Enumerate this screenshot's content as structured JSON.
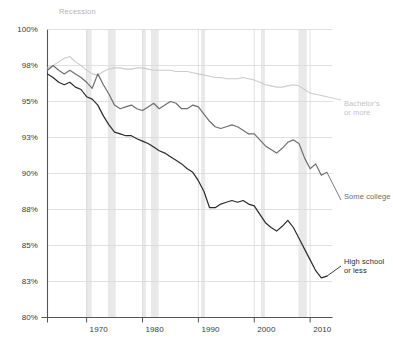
{
  "chart_data": {
    "type": "line",
    "title": "",
    "subtitle": "",
    "xlabel": "",
    "ylabel": "",
    "xlim": [
      1963,
      2014
    ],
    "ylim": [
      80,
      100
    ],
    "grid": true,
    "legend_position": "right-inline",
    "y_ticks": [
      "100%",
      "98%",
      "95%",
      "93%",
      "90%",
      "88%",
      "85%",
      "83%",
      "80%"
    ],
    "y_tick_values": [
      100,
      98,
      95,
      93,
      90,
      88,
      85,
      83,
      80
    ],
    "x_ticks": [
      "1970",
      "1980",
      "1990",
      "2000",
      "2010"
    ],
    "x_tick_values": [
      1970,
      1980,
      1990,
      2000,
      2010
    ],
    "annotations": [
      {
        "name": "recession-label",
        "text": "Recession",
        "x": 1966.5,
        "y": 100.6
      }
    ],
    "recession_bands": [
      {
        "start": 1969.9,
        "end": 1970.9
      },
      {
        "start": 1973.8,
        "end": 1975.2
      },
      {
        "start": 1980.0,
        "end": 1980.6
      },
      {
        "start": 1981.5,
        "end": 1982.9
      },
      {
        "start": 1990.5,
        "end": 1991.2
      },
      {
        "start": 2001.2,
        "end": 2001.9
      },
      {
        "start": 2007.9,
        "end": 2009.4
      }
    ],
    "series": [
      {
        "name": "Bachelor's or more",
        "color": "#cccccc",
        "label": "Bachelor's or more",
        "label_lines": [
          "Bachelor's",
          "or more"
        ],
        "x": [
          1963,
          1964,
          1965,
          1966,
          1967,
          1968,
          1969,
          1970,
          1971,
          1972,
          1973,
          1974,
          1975,
          1976,
          1977,
          1978,
          1979,
          1980,
          1981,
          1982,
          1983,
          1984,
          1985,
          1986,
          1987,
          1988,
          1989,
          1990,
          1991,
          1992,
          1993,
          1994,
          1995,
          1996,
          1997,
          1998,
          1999,
          2000,
          2001,
          2002,
          2003,
          2004,
          2005,
          2006,
          2007,
          2008,
          2009,
          2010,
          2011,
          2012,
          2013
        ],
        "values": [
          97.8,
          98.0,
          98.2,
          98.4,
          98.5,
          98.2,
          98.0,
          97.6,
          97.3,
          97.2,
          97.5,
          97.7,
          97.8,
          97.8,
          97.7,
          97.7,
          97.8,
          97.8,
          97.7,
          97.6,
          97.6,
          97.6,
          97.6,
          97.5,
          97.5,
          97.5,
          97.4,
          97.3,
          97.2,
          97.1,
          97.0,
          97.0,
          96.9,
          96.9,
          96.9,
          97.0,
          96.9,
          96.8,
          96.6,
          96.4,
          96.3,
          96.2,
          96.2,
          96.3,
          96.4,
          96.3,
          96.0,
          95.7,
          95.6,
          95.5,
          95.4
        ]
      },
      {
        "name": "Some college",
        "color": "#6e6e6e",
        "label": "Some college",
        "label_lines": [
          "Some college"
        ],
        "x": [
          1963,
          1964,
          1965,
          1966,
          1967,
          1968,
          1969,
          1970,
          1971,
          1972,
          1973,
          1974,
          1975,
          1976,
          1977,
          1978,
          1979,
          1980,
          1981,
          1982,
          1983,
          1984,
          1985,
          1986,
          1987,
          1988,
          1989,
          1990,
          1991,
          1992,
          1993,
          1994,
          1995,
          1996,
          1997,
          1998,
          1999,
          2000,
          2001,
          2002,
          2003,
          2004,
          2005,
          2006,
          2007,
          2008,
          2009,
          2010,
          2011,
          2012,
          2013
        ],
        "values": [
          97.6,
          98.0,
          97.6,
          97.3,
          97.6,
          97.3,
          97.0,
          96.6,
          96.1,
          97.3,
          96.4,
          95.6,
          94.8,
          94.6,
          94.7,
          94.8,
          94.6,
          94.5,
          94.7,
          94.9,
          94.6,
          94.8,
          95.0,
          94.9,
          94.6,
          94.6,
          94.8,
          94.7,
          94.3,
          93.9,
          93.6,
          93.5,
          93.6,
          93.7,
          93.6,
          93.4,
          93.2,
          93.2,
          92.8,
          92.3,
          92.0,
          91.7,
          92.1,
          92.6,
          92.8,
          92.5,
          91.3,
          90.4,
          90.8,
          89.9,
          90.1
        ]
      },
      {
        "name": "High school or less",
        "color": "#2b2b2b",
        "label": "High school or less",
        "label_lines": [
          "High school",
          "or less"
        ],
        "x": [
          1963,
          1964,
          1965,
          1966,
          1967,
          1968,
          1969,
          1970,
          1971,
          1972,
          1973,
          1974,
          1975,
          1976,
          1977,
          1978,
          1979,
          1980,
          1981,
          1982,
          1983,
          1984,
          1985,
          1986,
          1987,
          1988,
          1989,
          1990,
          1991,
          1992,
          1993,
          1994,
          1995,
          1996,
          1997,
          1998,
          1999,
          2000,
          2001,
          2002,
          2003,
          2004,
          2005,
          2006,
          2007,
          2008,
          2009,
          2010,
          2011,
          2012,
          2013
        ],
        "values": [
          97.3,
          97.0,
          96.6,
          96.4,
          96.6,
          96.2,
          96.0,
          95.4,
          95.2,
          94.8,
          94.2,
          93.7,
          93.3,
          93.2,
          93.1,
          93.1,
          92.9,
          92.7,
          92.5,
          92.2,
          91.9,
          91.7,
          91.4,
          91.1,
          90.8,
          90.4,
          90.1,
          89.6,
          89.0,
          88.1,
          88.1,
          88.3,
          88.4,
          88.5,
          88.4,
          88.5,
          88.3,
          88.2,
          87.6,
          86.9,
          86.5,
          86.2,
          86.6,
          87.1,
          86.5,
          85.6,
          84.8,
          84.2,
          83.6,
          83.2,
          83.3
        ]
      }
    ]
  },
  "axis": {
    "y_tick_labels": [
      "100%",
      "98%",
      "95%",
      "93%",
      "90%",
      "88%",
      "85%",
      "83%",
      "80%"
    ],
    "x_tick_labels": [
      "1970",
      "1980",
      "1990",
      "2000",
      "2010"
    ]
  },
  "labels": {
    "recession": "Recession",
    "bachelors_line1": "Bachelor's",
    "bachelors_line2": "or more",
    "some_college": "Some college",
    "highschool_line1": "High school",
    "highschool_line2": "or less"
  },
  "colors": {
    "bachelors": "#cccccc",
    "some_college": "#6e6e6e",
    "high_school": "#2b2b2b",
    "recession_band": "#e9e9e9",
    "grid": "#d8d8d8",
    "axis": "#555555"
  }
}
